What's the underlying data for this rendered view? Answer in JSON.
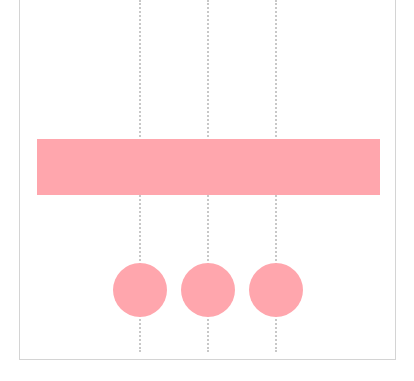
{
  "diagram": {
    "fill_color": "#ffa6ad",
    "guide_color": "#c8c8c8",
    "frame_color": "#d4d4d4",
    "bar": {
      "x": 37,
      "y": 139,
      "width": 343,
      "height": 56
    },
    "guides_x": [
      140,
      208,
      276
    ],
    "circles": [
      {
        "cx": 140,
        "cy": 290,
        "r": 27
      },
      {
        "cx": 208,
        "cy": 290,
        "r": 27
      },
      {
        "cx": 276,
        "cy": 290,
        "r": 27
      }
    ]
  }
}
